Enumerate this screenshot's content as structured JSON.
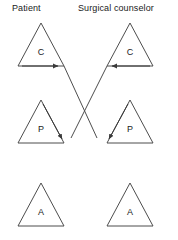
{
  "columns": {
    "left": {
      "header": "Patient"
    },
    "right": {
      "header": "Surgical counselor"
    }
  },
  "rows": [
    {
      "id": "row-c",
      "left_label": "C",
      "right_label": "C",
      "left_arrow": "right-arrow",
      "right_arrow": "left-arrow"
    },
    {
      "id": "row-p",
      "left_label": "P",
      "right_label": "P",
      "left_arrow": "down-right-arrow",
      "right_arrow": "down-left-arrow"
    },
    {
      "id": "row-a",
      "left_label": "A",
      "right_label": "A",
      "left_arrow": "none",
      "right_arrow": "none"
    }
  ],
  "colors": {
    "stroke": "#4d4d4d",
    "arrow": "#3a3a3a",
    "text": "#1a1a1a",
    "background": "#ffffff"
  }
}
